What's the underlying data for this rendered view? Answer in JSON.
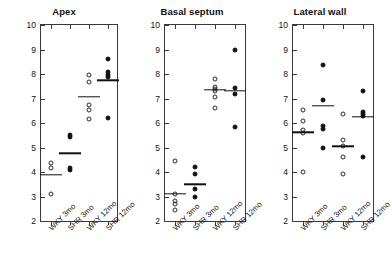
{
  "figure": {
    "y_axis_title": "Collagen fraction (%)",
    "categories": [
      "WKY 3mo",
      "SHR 3mo",
      "WKY 12mo",
      "SHR 12mo"
    ],
    "y_ticks": [
      2,
      3,
      4,
      5,
      6,
      7,
      8,
      9,
      10
    ]
  },
  "chart_data": {
    "type": "scatter",
    "xlabel": "",
    "ylabel": "Collagen fraction (%)",
    "ylim": [
      2,
      10
    ],
    "yticks": [
      2,
      3,
      4,
      5,
      6,
      7,
      8,
      9,
      10
    ],
    "grid": false,
    "legend": "none",
    "categories": [
      "WKY 3mo",
      "SHR 3mo",
      "WKY 12mo",
      "SHR 12mo"
    ],
    "marker_styles": {
      "WKY 3mo": "open-circle",
      "SHR 3mo": "filled-circle",
      "WKY 12mo": "open-circle",
      "SHR 12mo": "filled-circle",
      "mean": "horizontal-line"
    },
    "panels": [
      {
        "title": "Apex",
        "groups": [
          {
            "name": "WKY 3mo",
            "marker": "open-circle",
            "values": [
              4.35,
              4.18,
              3.12
            ],
            "mean": 3.88
          },
          {
            "name": "SHR 3mo",
            "marker": "filled-circle",
            "values": [
              5.5,
              5.42,
              4.15,
              4.08
            ],
            "mean": 4.77
          },
          {
            "name": "WKY 12mo",
            "marker": "open-circle",
            "values": [
              7.95,
              7.68,
              6.75,
              6.52,
              6.18
            ],
            "mean": 7.08
          },
          {
            "name": "SHR 12mo",
            "marker": "filled-circle",
            "values": [
              8.6,
              8.08,
              7.95,
              7.88,
              6.22
            ],
            "mean": 7.75
          }
        ]
      },
      {
        "title": "Basal septum",
        "groups": [
          {
            "name": "WKY 3mo",
            "marker": "open-circle",
            "values": [
              4.45,
              3.1,
              2.8,
              2.68,
              2.45
            ],
            "mean": 3.1
          },
          {
            "name": "SHR 3mo",
            "marker": "filled-circle",
            "values": [
              4.22,
              3.9,
              3.32,
              2.98
            ],
            "mean": 3.5
          },
          {
            "name": "WKY 12mo",
            "marker": "open-circle",
            "values": [
              7.78,
              7.45,
              7.38,
              7.3,
              7.08,
              6.62
            ],
            "mean": 7.35
          },
          {
            "name": "SHR 12mo",
            "marker": "filled-circle",
            "values": [
              8.98,
              7.42,
              7.18,
              5.85
            ],
            "mean": 7.32
          }
        ]
      },
      {
        "title": "Lateral wall",
        "groups": [
          {
            "name": "WKY 3mo",
            "marker": "open-circle",
            "values": [
              6.55,
              6.1,
              5.7,
              5.58,
              4.02
            ],
            "mean": 5.62
          },
          {
            "name": "SHR 3mo",
            "marker": "filled-circle",
            "values": [
              8.35,
              6.95,
              5.88,
              5.75,
              4.98
            ],
            "mean": 6.7
          },
          {
            "name": "WKY 12mo",
            "marker": "open-circle",
            "values": [
              6.38,
              5.32,
              5.05,
              4.62,
              3.92
            ],
            "mean": 5.05
          },
          {
            "name": "SHR 12mo",
            "marker": "filled-circle",
            "values": [
              7.32,
              6.45,
              6.35,
              6.28,
              4.62
            ],
            "mean": 6.25
          }
        ]
      }
    ]
  }
}
